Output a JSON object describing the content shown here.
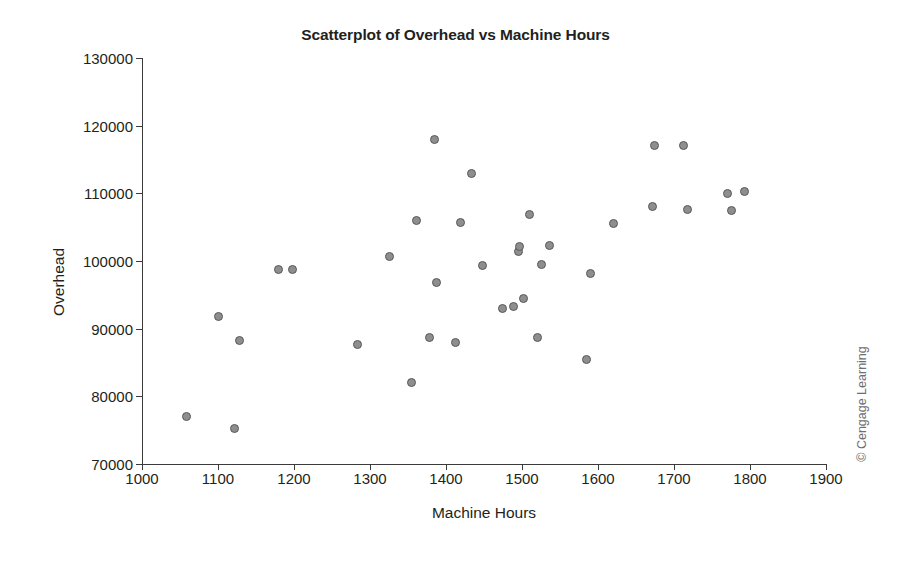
{
  "chart_data": {
    "type": "scatter",
    "title": "Scatterplot of Overhead vs Machine Hours",
    "xlabel": "Machine Hours",
    "ylabel": "Overhead",
    "xlim": [
      1000,
      1900
    ],
    "ylim": [
      70000,
      130000
    ],
    "xticks": [
      1000,
      1100,
      1200,
      1300,
      1400,
      1500,
      1600,
      1700,
      1800,
      1900
    ],
    "yticks": [
      70000,
      80000,
      90000,
      100000,
      110000,
      120000,
      130000
    ],
    "grid": false,
    "legend": null,
    "marker": {
      "shape": "circle",
      "fill_color": "#8e8e8e",
      "edge_color": "#58595b",
      "size_px": 9
    },
    "series": [
      {
        "name": "Overhead vs Machine Hours",
        "points": [
          {
            "x": 1058,
            "y": 77000
          },
          {
            "x": 1100,
            "y": 91800
          },
          {
            "x": 1122,
            "y": 75300
          },
          {
            "x": 1128,
            "y": 88300
          },
          {
            "x": 1180,
            "y": 98800
          },
          {
            "x": 1198,
            "y": 98700
          },
          {
            "x": 1284,
            "y": 87700
          },
          {
            "x": 1326,
            "y": 100700
          },
          {
            "x": 1355,
            "y": 82100
          },
          {
            "x": 1361,
            "y": 106000
          },
          {
            "x": 1378,
            "y": 88700
          },
          {
            "x": 1385,
            "y": 118000
          },
          {
            "x": 1388,
            "y": 96800
          },
          {
            "x": 1413,
            "y": 88000
          },
          {
            "x": 1419,
            "y": 105700
          },
          {
            "x": 1433,
            "y": 113000
          },
          {
            "x": 1448,
            "y": 99400
          },
          {
            "x": 1474,
            "y": 93000
          },
          {
            "x": 1489,
            "y": 93300
          },
          {
            "x": 1495,
            "y": 101400
          },
          {
            "x": 1497,
            "y": 102200
          },
          {
            "x": 1502,
            "y": 94400
          },
          {
            "x": 1510,
            "y": 106900
          },
          {
            "x": 1520,
            "y": 88700
          },
          {
            "x": 1525,
            "y": 99500
          },
          {
            "x": 1536,
            "y": 102300
          },
          {
            "x": 1585,
            "y": 85400
          },
          {
            "x": 1590,
            "y": 98200
          },
          {
            "x": 1620,
            "y": 105600
          },
          {
            "x": 1672,
            "y": 108000
          },
          {
            "x": 1674,
            "y": 117000
          },
          {
            "x": 1712,
            "y": 117000
          },
          {
            "x": 1718,
            "y": 107600
          },
          {
            "x": 1770,
            "y": 110000
          },
          {
            "x": 1775,
            "y": 107500
          },
          {
            "x": 1793,
            "y": 110300
          }
        ]
      }
    ]
  },
  "credit": "© Cengage Learning"
}
